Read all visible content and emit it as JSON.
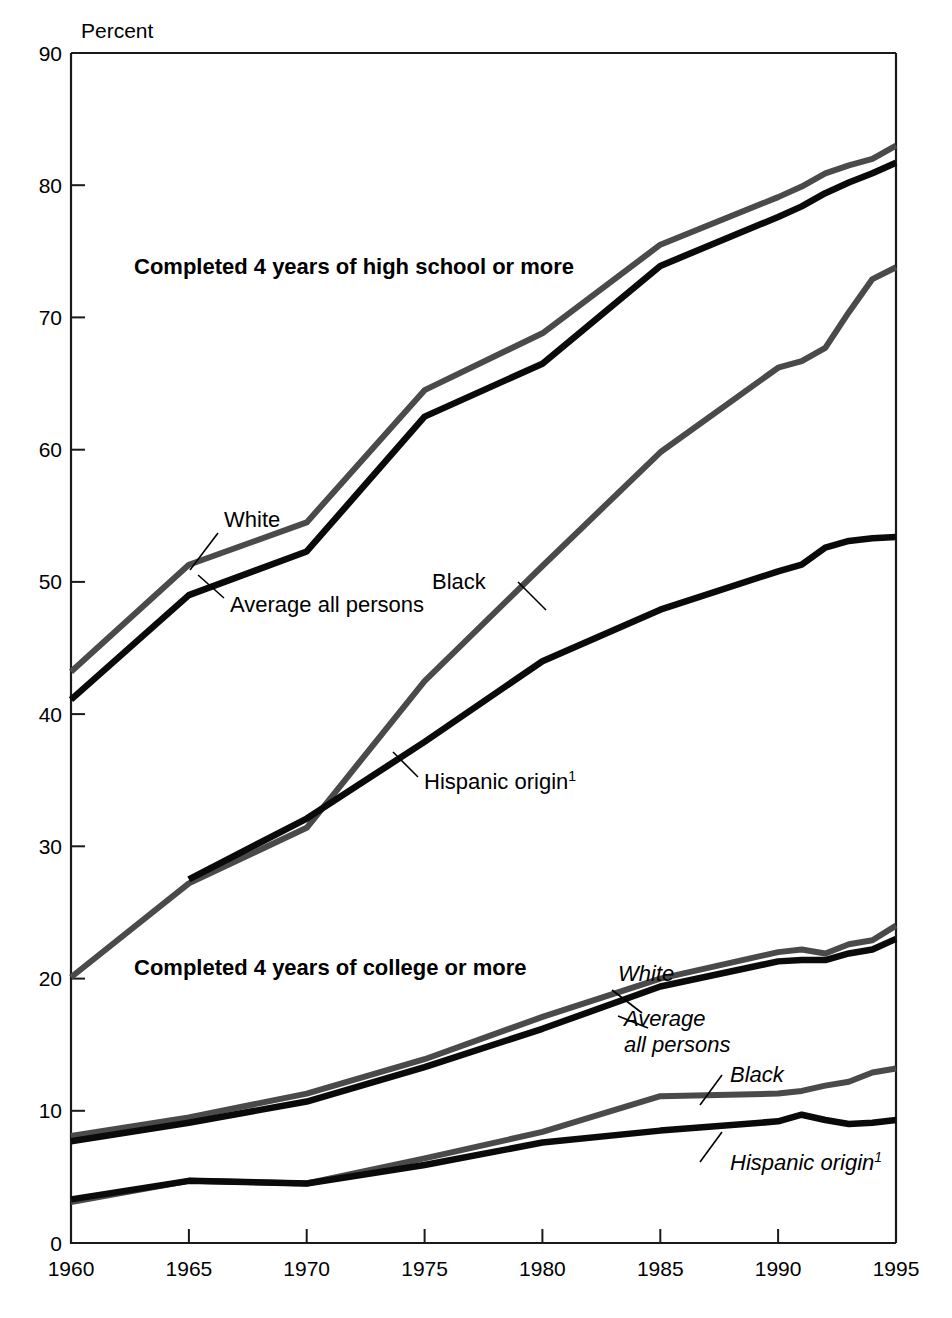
{
  "chart_data": {
    "type": "line",
    "title": "",
    "xlabel": "",
    "ylabel": "Percent",
    "xlim": [
      1960,
      1995
    ],
    "ylim": [
      0,
      90
    ],
    "grid": false,
    "legend_position": "inline-callouts",
    "x_ticks": [
      "1960",
      "1965",
      "1970",
      "1975",
      "1980",
      "1985",
      "1990",
      "1995"
    ],
    "y_ticks": [
      "0",
      "10",
      "20",
      "30",
      "40",
      "50",
      "60",
      "70",
      "80",
      "90"
    ],
    "group_labels": {
      "high_school": "Completed 4 years of high school or more",
      "college": "Completed 4 years of college or more"
    },
    "callouts": {
      "hs_white": "White",
      "hs_average": "Average all persons",
      "hs_black": "Black",
      "hs_hispanic": "Hispanic origin",
      "hs_hispanic_superscript": "1",
      "col_white": "White",
      "col_average_line1": "Average",
      "col_average_line2": "all persons",
      "col_black": "Black",
      "col_hispanic": "Hispanic origin",
      "col_hispanic_superscript": "1"
    },
    "colors": {
      "black_series": "#0a0a0a",
      "gray_series": "#4a4a4a",
      "axis": "#1a1a1a",
      "background": "#ffffff"
    },
    "x": [
      1960,
      1965,
      1970,
      1975,
      1980,
      1985,
      1990,
      1991,
      1992,
      1993,
      1994,
      1995
    ],
    "series": [
      {
        "name": "White — Completed 4 years of high school or more",
        "group": "high_school",
        "style": "gray",
        "values": [
          43.2,
          51.3,
          54.5,
          64.5,
          68.8,
          75.5,
          79.1,
          79.9,
          80.9,
          81.5,
          82.0,
          83.0
        ]
      },
      {
        "name": "Average all persons — Completed 4 years of high school or more",
        "group": "high_school",
        "style": "black",
        "values": [
          41.1,
          49.0,
          52.3,
          62.5,
          66.5,
          73.9,
          77.6,
          78.4,
          79.4,
          80.2,
          80.9,
          81.7
        ]
      },
      {
        "name": "Black — Completed 4 years of high school or more",
        "group": "high_school",
        "style": "gray",
        "values": [
          20.1,
          27.2,
          31.4,
          42.5,
          51.2,
          59.8,
          66.2,
          66.7,
          67.7,
          70.4,
          72.9,
          73.8
        ]
      },
      {
        "name": "Hispanic origin — Completed 4 years of high school or more",
        "group": "high_school",
        "style": "black",
        "values": [
          3.3,
          27.5,
          32.1,
          37.9,
          44.0,
          47.9,
          50.8,
          51.3,
          52.6,
          53.1,
          53.3,
          53.4
        ]
      },
      {
        "name": "White — Completed 4 years of college or more",
        "group": "college",
        "style": "gray",
        "values": [
          8.1,
          9.5,
          11.3,
          13.9,
          17.1,
          20.0,
          22.0,
          22.2,
          21.9,
          22.6,
          22.9,
          24.0
        ]
      },
      {
        "name": "Average all persons — Completed 4 years of college or more",
        "group": "college",
        "style": "black",
        "values": [
          7.7,
          9.1,
          10.7,
          13.3,
          16.2,
          19.4,
          21.3,
          21.4,
          21.4,
          21.9,
          22.2,
          23.0
        ]
      },
      {
        "name": "Black — Completed 4 years of college or more",
        "group": "college",
        "style": "gray",
        "values": [
          3.1,
          4.7,
          4.5,
          6.4,
          8.4,
          11.1,
          11.3,
          11.5,
          11.9,
          12.2,
          12.9,
          13.2
        ]
      },
      {
        "name": "Hispanic origin — Completed 4 years of college or more",
        "group": "college",
        "style": "black",
        "values": [
          3.3,
          4.7,
          4.5,
          5.9,
          7.6,
          8.5,
          9.2,
          9.7,
          9.3,
          9.0,
          9.1,
          9.3
        ]
      }
    ],
    "notes": {
      "footnote_marker": "1"
    }
  }
}
